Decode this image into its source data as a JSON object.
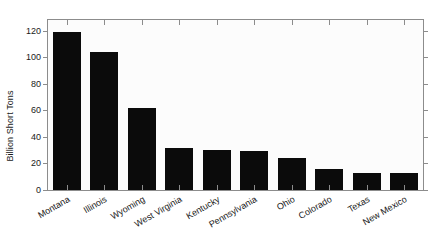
{
  "chart_data": {
    "type": "bar",
    "title": "",
    "subtitle": "",
    "xlabel": "",
    "ylabel": "Billion Short Tons",
    "categories": [
      "Montana",
      "Illinois",
      "Wyoming",
      "West Virginia",
      "Kentucky",
      "Pennsylvania",
      "Ohio",
      "Colorado",
      "Texas",
      "New Mexico"
    ],
    "values": [
      119,
      104,
      62,
      32,
      30,
      29,
      24,
      16,
      13,
      13
    ],
    "series": [
      {
        "name": "Recoverable coal reserves",
        "values": [
          119,
          104,
          62,
          32,
          30,
          29,
          24,
          16,
          13,
          13
        ]
      }
    ],
    "ylim": [
      0,
      128
    ],
    "yticks": [
      0,
      20,
      40,
      60,
      80,
      100,
      120
    ],
    "ytick_labels": [
      "0",
      "20",
      "40",
      "60",
      "80",
      "100",
      "120"
    ],
    "grid": false,
    "legend": "none",
    "bar_color": "#0b0b0b",
    "axis_color": "#8c8c8c",
    "text_color": "#1a1a1a",
    "plot_background": "#fcfcfc",
    "figure_background": "#ffffff",
    "xtick_rotation_deg": -30
  }
}
